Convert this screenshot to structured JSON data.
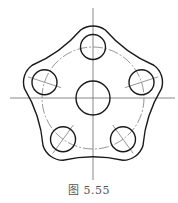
{
  "figure": {
    "caption": "图 5.55",
    "center": [
      93,
      98
    ],
    "pitch_radius": 51,
    "central_hole_radius": 17,
    "hole_radius": 12.5,
    "lobe_radius": 21,
    "hole_angles_deg": [
      90,
      162,
      234,
      306,
      18
    ],
    "colors": {
      "outline": "#1a1a1a",
      "centerline": "#6a6a6a",
      "background": "#ffffff",
      "caption": "#555555"
    }
  }
}
